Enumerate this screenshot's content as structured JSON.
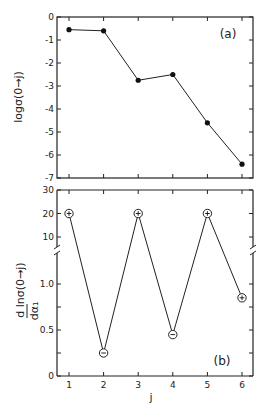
{
  "chart_data": [
    {
      "type": "line",
      "panel_label": "(a)",
      "xlabel": "",
      "ylabel": "log σ(0→j)",
      "x": [
        1,
        2,
        3,
        4,
        5,
        6
      ],
      "series": [
        {
          "name": "log σ(0→j)",
          "values": [
            -0.55,
            -0.6,
            -2.75,
            -2.5,
            -4.6,
            -6.4
          ],
          "marker": "filled-circle"
        }
      ],
      "ylim": [
        -7,
        0
      ],
      "yticks": [
        "0",
        "-1",
        "-2",
        "-3",
        "-4",
        "-5",
        "-6",
        "-7"
      ],
      "grid": false
    },
    {
      "type": "line",
      "panel_label": "(b)",
      "xlabel": "j",
      "ylabel": "d ln σ(0→j) / dα₁",
      "x": [
        1,
        2,
        3,
        4,
        5,
        6
      ],
      "xticks": [
        "1",
        "2",
        "3",
        "4",
        "5",
        "6"
      ],
      "series": [
        {
          "name": "d ln σ / dα₁",
          "values": [
            20,
            0.25,
            20,
            0.45,
            20,
            0.85
          ],
          "signs": [
            "+",
            "−",
            "+",
            "−",
            "+",
            "+"
          ],
          "marker": "open-circle-with-sign"
        }
      ],
      "ylim": [
        0,
        30
      ],
      "y_axis_break": true,
      "yticks_upper": [
        "30",
        "20",
        "10"
      ],
      "yticks_lower": [
        "1.0",
        "0.5",
        "0"
      ],
      "grid": false
    }
  ],
  "labels": {
    "panel_a": "(a)",
    "panel_b": "(b)",
    "ylabel_a": "logσ(0→j)",
    "ylabel_b_num": "d lnσ(0→j)",
    "ylabel_b_den": "dα₁",
    "xlabel": "j"
  }
}
